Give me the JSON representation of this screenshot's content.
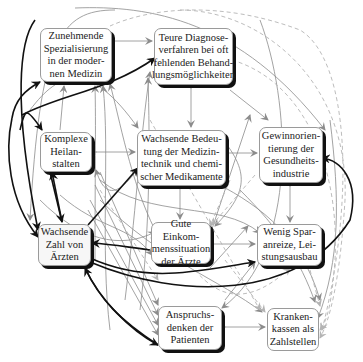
{
  "diagram": {
    "type": "causal-relationship-network",
    "nodes": [
      {
        "id": "spezialisierung",
        "lines": [
          "Zunehmende",
          "Spezialisierung",
          "in der moder-",
          "nen Medizin"
        ]
      },
      {
        "id": "diagnose",
        "lines": [
          "Teure Diagnose-",
          "verfahren  bei oft",
          "fehlenden Behand-",
          "lungsmöglichkeiten"
        ]
      },
      {
        "id": "heilanstalten",
        "lines": [
          "Komplexe",
          "Heilan-",
          "stalten"
        ]
      },
      {
        "id": "medizintechnik",
        "lines": [
          "Wachsende Bedeu-",
          "tung der Medizin-",
          "technik und chemi-",
          "scher Medikamente"
        ]
      },
      {
        "id": "gewinn",
        "lines": [
          "Gewinnorien-",
          "tierung der",
          "Gesundheits-",
          "industrie"
        ]
      },
      {
        "id": "aerzte",
        "lines": [
          "Wachsende",
          "Zahl von",
          "Ärzten"
        ]
      },
      {
        "id": "einkommen",
        "lines": [
          "Gute Einkom-",
          "menssituation",
          "der Ärzte"
        ]
      },
      {
        "id": "sparanreize",
        "lines": [
          "Wenig Spar-",
          "anreize, Lei-",
          "stungsausbau"
        ]
      },
      {
        "id": "anspruch",
        "lines": [
          "Anspruchs-",
          "denken  der",
          "Patienten"
        ]
      },
      {
        "id": "krankenkassen",
        "lines": [
          "Kranken-",
          "kassen als",
          "Zahlstellen"
        ]
      }
    ],
    "edge_styles": {
      "strong": "#111111",
      "normal": "#8c8c8c",
      "weak_dashed": "#b4b4b4"
    }
  }
}
